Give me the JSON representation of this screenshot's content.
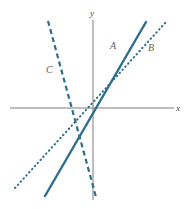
{
  "figure": {
    "background_color": "#ffffff",
    "line_color": "#2c6e8e",
    "axis_color": "#7d7d7d",
    "label_color": "#6b5a52",
    "axis_label_color": "#4a4a4a",
    "width": 188,
    "height": 209
  },
  "axes": {
    "x_label": "x",
    "y_label": "y",
    "origin": {
      "x": 93,
      "y": 108
    },
    "x_axis": {
      "x1": 10,
      "y1": 108,
      "x2": 174,
      "y2": 108
    },
    "y_axis": {
      "x1": 93,
      "y1": 20,
      "x2": 93,
      "y2": 200
    }
  },
  "labels": {
    "a": "A",
    "b": "B",
    "c": "C"
  },
  "chart_data": {
    "type": "line",
    "title": "",
    "xlabel": "x",
    "ylabel": "y",
    "grid": false,
    "legend": "inline-labels",
    "axis_style": "cartesian-cross",
    "xlim": [
      -5.5,
      5.5
    ],
    "ylim": [
      -5.5,
      5.5
    ],
    "series": [
      {
        "name": "A",
        "label": "A",
        "style": "solid",
        "color": "#2c6e8e",
        "width": 2.4,
        "slope": 2.45,
        "intercept": 0.2,
        "x": [
          -3.0,
          1.8
        ],
        "y": [
          -7.15,
          6.6
        ],
        "pixel_endpoints": [
          [
            45,
            196
          ],
          [
            146,
            22
          ]
        ],
        "label_position": [
          112,
          46
        ]
      },
      {
        "name": "B",
        "label": "B",
        "style": "dotted",
        "color": "#2c6e8e",
        "width": 2.0,
        "slope": 1.1,
        "intercept": 0.25,
        "x": [
          -4.7,
          2.4
        ],
        "y": [
          -4.9,
          2.9
        ],
        "pixel_endpoints": [
          [
            15,
            188
          ],
          [
            166,
            22
          ]
        ],
        "label_position": [
          150,
          48
        ]
      },
      {
        "name": "C",
        "label": "C",
        "style": "dashed",
        "color": "#2c6e8e",
        "width": 2.2,
        "slope": -3.6,
        "intercept": -0.1,
        "x": [
          -2.65,
          0.15
        ],
        "y": [
          9.45,
          -0.6
        ],
        "pixel_endpoints": [
          [
            48,
            21
          ],
          [
            96,
            197
          ]
        ],
        "label_position": [
          48,
          70
        ]
      }
    ]
  }
}
